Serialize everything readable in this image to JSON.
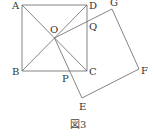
{
  "figure": {
    "caption": "図3",
    "points": {
      "A": {
        "label": "A",
        "x": 22,
        "y": 5
      },
      "B": {
        "label": "B",
        "x": 22,
        "y": 71
      },
      "C": {
        "label": "C",
        "x": 87,
        "y": 71
      },
      "D": {
        "label": "D",
        "x": 87,
        "y": 5
      },
      "O": {
        "label": "O",
        "x": 54.5,
        "y": 38
      },
      "G": {
        "label": "G",
        "x": 112,
        "y": 9
      },
      "F": {
        "label": "F",
        "x": 139,
        "y": 69
      },
      "E": {
        "label": "E",
        "x": 82,
        "y": 98
      },
      "P": {
        "label": "P",
        "x": 68,
        "y": 71
      },
      "Q": {
        "label": "Q",
        "x": 87,
        "y": 24
      }
    },
    "shapes": [
      "square ABCD",
      "square OEFG",
      "diagonal AC",
      "diagonal BD"
    ]
  }
}
